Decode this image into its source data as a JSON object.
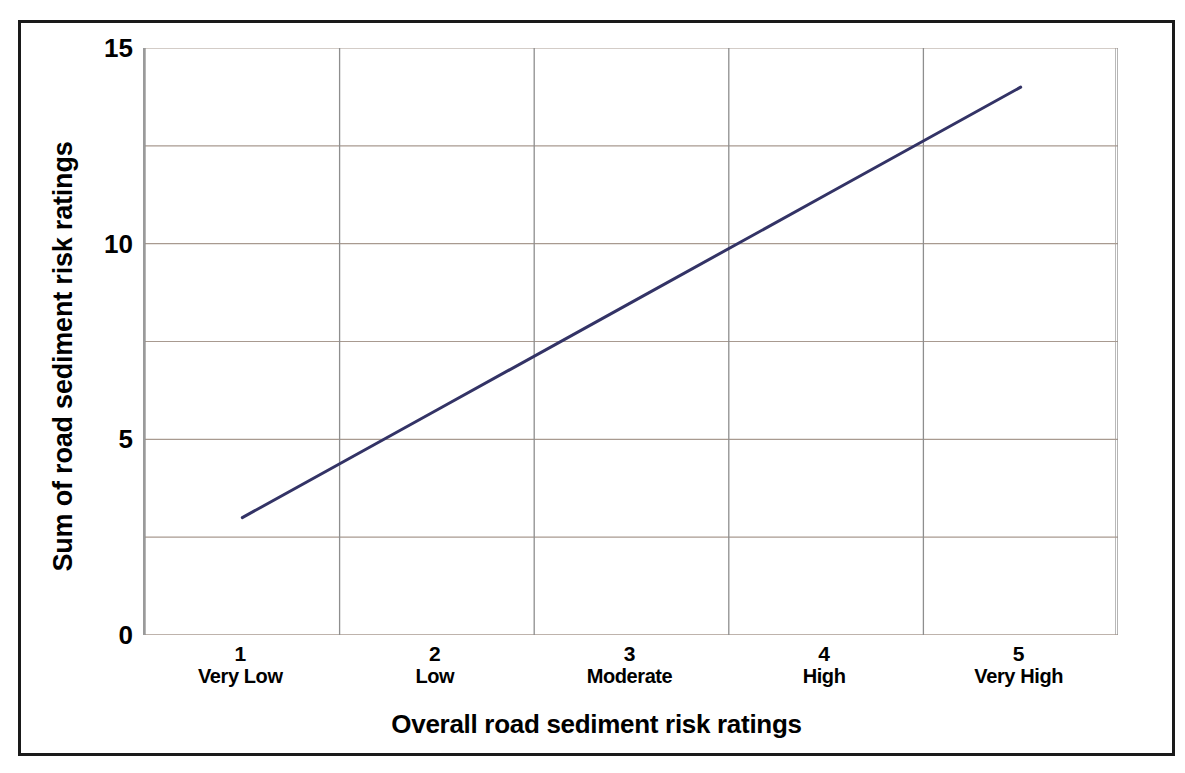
{
  "chart_data": {
    "type": "line",
    "title": "",
    "xlabel": "Overall road sediment risk ratings",
    "ylabel": "Sum of road sediment risk ratings",
    "categories": [
      "1",
      "2",
      "3",
      "4",
      "5"
    ],
    "category_names": [
      "Very Low",
      "Low",
      "Moderate",
      "High",
      "Very High"
    ],
    "x": [
      1,
      2,
      3,
      4,
      5
    ],
    "values": [
      3,
      5.75,
      8.5,
      11.25,
      14
    ],
    "series": [
      {
        "name": "Sum of road sediment risk ratings",
        "color": "#333366",
        "values": [
          3,
          5.75,
          8.5,
          11.25,
          14
        ]
      }
    ],
    "ylim": [
      0,
      15
    ],
    "xlim": [
      0.5,
      5.5
    ],
    "y_ticks": [
      0,
      5,
      10,
      15
    ],
    "y_tick_labels": [
      "0",
      "5",
      "10",
      "15"
    ],
    "y_minor_gridlines": [
      2.5,
      7.5,
      12.5
    ],
    "x_gridlines": [
      0.5,
      1.5,
      2.5,
      3.5,
      4.5,
      5.5
    ],
    "grid": true,
    "grid_color": "#a89a90",
    "legend": "none",
    "line_color": "#333366",
    "line_width": 3,
    "plot_border_color": "#9a9a9a",
    "frame_color": "#1a1a1a",
    "background": "#ffffff"
  },
  "y_axis": {
    "title": "Sum of road sediment risk ratings",
    "ticks": [
      {
        "label": "15",
        "value": 15
      },
      {
        "label": "10",
        "value": 10
      },
      {
        "label": "5",
        "value": 5
      },
      {
        "label": "0",
        "value": 0
      }
    ]
  },
  "x_axis": {
    "title": "Overall road sediment risk ratings",
    "ticks": [
      {
        "num": "1",
        "name": "Very Low",
        "value": 1
      },
      {
        "num": "2",
        "name": "Low",
        "value": 2
      },
      {
        "num": "3",
        "name": "Moderate",
        "value": 3
      },
      {
        "num": "4",
        "name": "High",
        "value": 4
      },
      {
        "num": "5",
        "name": "Very High",
        "value": 5
      }
    ]
  }
}
